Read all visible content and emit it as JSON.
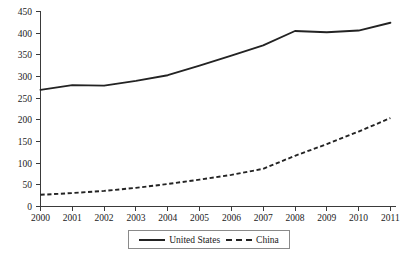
{
  "chart_data": {
    "type": "line",
    "title": "",
    "subtitle": "",
    "xlabel": "",
    "ylabel": "",
    "x": [
      2000,
      2001,
      2002,
      2003,
      2004,
      2005,
      2006,
      2007,
      2008,
      2009,
      2010,
      2011
    ],
    "categories": [
      "2000",
      "2001",
      "2002",
      "2003",
      "2004",
      "2005",
      "2006",
      "2007",
      "2008",
      "2009",
      "2010",
      "2011"
    ],
    "series": [
      {
        "name": "United States",
        "style": "solid",
        "color": "#232323",
        "values": [
          269,
          280,
          279,
          290,
          303,
          325,
          348,
          372,
          405,
          402,
          406,
          424
        ]
      },
      {
        "name": "China",
        "style": "dashed",
        "color": "#232323",
        "values": [
          27,
          31,
          36,
          43,
          52,
          62,
          73,
          87,
          117,
          144,
          173,
          204
        ]
      }
    ],
    "xlim": [
      2000,
      2011
    ],
    "ylim": [
      0,
      450
    ],
    "yticks": [
      0,
      50,
      100,
      150,
      200,
      250,
      300,
      350,
      400,
      450
    ],
    "ytick_labels": [
      "0",
      "50",
      "100",
      "150",
      "200",
      "250",
      "300",
      "350",
      "400",
      "450"
    ],
    "xtick_labels": [
      "2000",
      "2001",
      "2002",
      "2003",
      "2004",
      "2005",
      "2006",
      "2007",
      "2008",
      "2009",
      "2010",
      "2011"
    ],
    "grid": false,
    "legend_position": "bottom",
    "legend_entries": [
      "United States",
      "China"
    ]
  },
  "legend": {
    "entry_us_label": "United States",
    "entry_china_label": "China"
  }
}
